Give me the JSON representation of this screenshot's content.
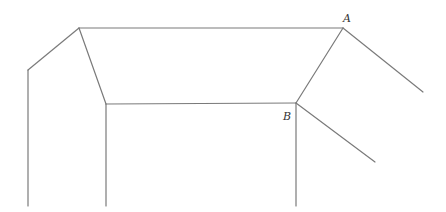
{
  "diagram": {
    "type": "line-drawing",
    "stroke_color": "#7a7a7a",
    "background": "#ffffff",
    "vertices": {
      "P_left_top": [
        28,
        70
      ],
      "P_peak": [
        79,
        28
      ],
      "P_inner": [
        106,
        104
      ],
      "A": [
        343,
        28
      ],
      "B": [
        296,
        103
      ],
      "A_end": [
        423,
        92
      ],
      "B_end": [
        375,
        162
      ]
    },
    "edges": [
      {
        "name": "left-slope",
        "from": [
          28,
          70
        ],
        "to": [
          79,
          28
        ]
      },
      {
        "name": "left-vertical",
        "from": [
          28,
          70
        ],
        "to": [
          28,
          206
        ]
      },
      {
        "name": "top-edge",
        "from": [
          79,
          28
        ],
        "to": [
          343,
          28
        ]
      },
      {
        "name": "inner-left-slope",
        "from": [
          79,
          28
        ],
        "to": [
          106,
          104
        ]
      },
      {
        "name": "inner-vertical",
        "from": [
          106,
          104
        ],
        "to": [
          106,
          206
        ]
      },
      {
        "name": "bottom-edge",
        "from": [
          106,
          104
        ],
        "to": [
          296,
          103
        ]
      },
      {
        "name": "right-slope",
        "from": [
          343,
          28
        ],
        "to": [
          296,
          103
        ]
      },
      {
        "name": "b-vertical",
        "from": [
          296,
          103
        ],
        "to": [
          296,
          206
        ]
      },
      {
        "name": "a-diagonal",
        "from": [
          343,
          28
        ],
        "to": [
          423,
          92
        ]
      },
      {
        "name": "b-diagonal",
        "from": [
          296,
          103
        ],
        "to": [
          375,
          162
        ]
      }
    ],
    "labels": [
      {
        "id": "A",
        "text": "A",
        "x": 343,
        "y": 13
      },
      {
        "id": "B",
        "text": "B",
        "x": 283,
        "y": 111
      }
    ]
  }
}
